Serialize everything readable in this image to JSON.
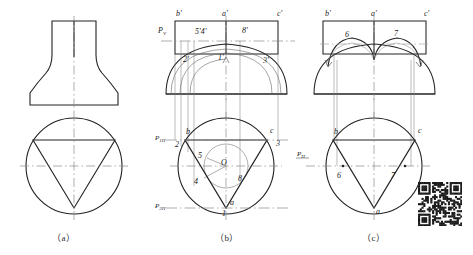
{
  "figure": {
    "captions": [
      {
        "key": "a",
        "text": "（a）",
        "x": 62,
        "y": 236
      },
      {
        "key": "b",
        "text": "（b）",
        "x": 225,
        "y": 236
      },
      {
        "key": "c",
        "text": "（c）",
        "x": 372,
        "y": 236
      }
    ],
    "colors": {
      "outline": "#222222",
      "thin": "#555555",
      "center_line": "#8a8a8a",
      "construction": "#777777",
      "background": "#ffffff",
      "text": "#222222"
    }
  },
  "panel_a": {
    "name": "stage-a-no-labels",
    "front_view": {
      "description": "flared body front view"
    },
    "top_view": {
      "description": "circle with inscribed inverted triangle"
    },
    "labels": []
  },
  "panel_b": {
    "name": "stage-b-construction",
    "front_view_labels": [
      {
        "text": "b'",
        "x": 176,
        "y": 16
      },
      {
        "text": "a'",
        "x": 222,
        "y": 16
      },
      {
        "text": "c'",
        "x": 277,
        "y": 16
      },
      {
        "text": "5'4'",
        "x": 195,
        "y": 34
      },
      {
        "text": "8'",
        "x": 242,
        "y": 33
      },
      {
        "text": "2'",
        "x": 183,
        "y": 62
      },
      {
        "text": "1'",
        "x": 218,
        "y": 60
      },
      {
        "text": "3'",
        "x": 263,
        "y": 63
      }
    ],
    "front_view_plane_label": {
      "text": "P",
      "sub": "V",
      "x": 160,
      "y": 32
    },
    "top_view_labels": [
      {
        "text": "b",
        "x": 186,
        "y": 134
      },
      {
        "text": "c",
        "x": 270,
        "y": 133
      },
      {
        "text": "2",
        "x": 177,
        "y": 145
      },
      {
        "text": "3",
        "x": 276,
        "y": 144
      },
      {
        "text": "5",
        "x": 198,
        "y": 157
      },
      {
        "text": "4",
        "x": 196,
        "y": 182
      },
      {
        "text": "8",
        "x": 238,
        "y": 180
      },
      {
        "text": "O",
        "x": 224,
        "y": 163
      },
      {
        "text": "a",
        "x": 230,
        "y": 204
      },
      {
        "text": "1",
        "x": 222,
        "y": 214
      }
    ],
    "top_view_plane_labels": [
      {
        "text": "P",
        "sub": "1H",
        "x": 157,
        "y": 138
      },
      {
        "text": "P",
        "sub": "2H",
        "x": 157,
        "y": 206
      }
    ]
  },
  "panel_c": {
    "name": "stage-c-result",
    "front_view_labels": [
      {
        "text": "b'",
        "x": 325,
        "y": 16
      },
      {
        "text": "a'",
        "x": 371,
        "y": 16
      },
      {
        "text": "c'",
        "x": 424,
        "y": 16
      },
      {
        "text": "6",
        "x": 346,
        "y": 37
      },
      {
        "text": "7",
        "x": 394,
        "y": 36
      }
    ],
    "top_view_labels": [
      {
        "text": "b",
        "x": 334,
        "y": 134
      },
      {
        "text": "c",
        "x": 418,
        "y": 133
      },
      {
        "text": "6",
        "x": 338,
        "y": 176
      },
      {
        "text": "7",
        "x": 391,
        "y": 176
      },
      {
        "text": "a",
        "x": 376,
        "y": 212
      }
    ],
    "top_view_plane_label": {
      "text": "P",
      "sub": "H",
      "x": 299,
      "y": 154
    }
  },
  "qr_code": {
    "name": "qr-code",
    "present": true,
    "modules": 25
  }
}
